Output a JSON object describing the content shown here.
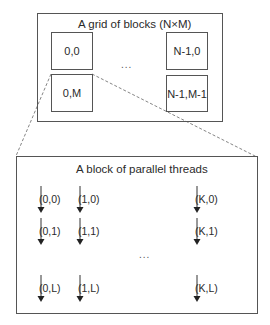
{
  "grid": {
    "title": "A grid of blocks (N×M)",
    "ellipsis": "...",
    "blocks": [
      {
        "label": "0,0"
      },
      {
        "label": "N-1,0"
      },
      {
        "label": "0,M"
      },
      {
        "label": "N-1,M-1"
      }
    ]
  },
  "block": {
    "title": "A block of parallel threads",
    "ellipsis": "...",
    "threads": [
      {
        "label": "(0,0)"
      },
      {
        "label": "(1,0)"
      },
      {
        "label": "(K,0)"
      },
      {
        "label": "(0,1)"
      },
      {
        "label": "(1,1)"
      },
      {
        "label": "(K,1)"
      },
      {
        "label": "(0,L)"
      },
      {
        "label": "(1,L)"
      },
      {
        "label": "(K,L)"
      }
    ]
  },
  "colors": {
    "line": "#555555",
    "text": "#2a2a2a",
    "background": "#ffffff"
  }
}
